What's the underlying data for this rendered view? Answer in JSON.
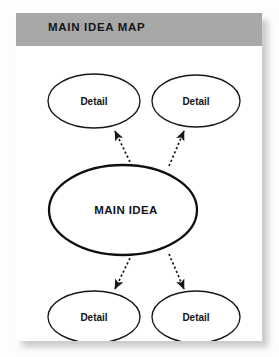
{
  "header": {
    "title": "MAIN IDEA MAP"
  },
  "colors": {
    "header_band": "#a8a8a8",
    "card_background": "#ffffff",
    "page_background": "#fdfdfd",
    "ink": "#15171b"
  },
  "diagram": {
    "type": "concept-map",
    "center_node": {
      "label": "MAIN IDEA",
      "shape": "ellipse",
      "cx": 107,
      "cy": 164,
      "rx": 74,
      "ry": 45
    },
    "detail_nodes": [
      {
        "id": "detail-top-left",
        "label": "Detail",
        "shape": "ellipse",
        "cx": 78,
        "cy": 55,
        "rx": 46,
        "ry": 27
      },
      {
        "id": "detail-top-right",
        "label": "Detail",
        "shape": "ellipse",
        "cx": 180,
        "cy": 55,
        "rx": 44,
        "ry": 26
      },
      {
        "id": "detail-bottom-left",
        "label": "Detail",
        "shape": "ellipse",
        "cx": 78,
        "cy": 271,
        "rx": 46,
        "ry": 26
      },
      {
        "id": "detail-bottom-right",
        "label": "Detail",
        "shape": "ellipse",
        "cx": 180,
        "cy": 271,
        "rx": 44,
        "ry": 26
      }
    ],
    "connectors": [
      {
        "id": "connector-to-top-left",
        "from": "center",
        "to": "detail-top-left",
        "style": "dotted",
        "arrowhead": "end",
        "x1": 116,
        "y1": 120,
        "x2": 99,
        "y2": 85
      },
      {
        "id": "connector-to-top-right",
        "from": "center",
        "to": "detail-top-right",
        "style": "dotted",
        "arrowhead": "end",
        "x1": 153,
        "y1": 120,
        "x2": 168,
        "y2": 85
      },
      {
        "id": "connector-to-bottom-left",
        "from": "center",
        "to": "detail-bottom-left",
        "style": "dotted",
        "arrowhead": "end",
        "x1": 116,
        "y1": 208,
        "x2": 99,
        "y2": 243
      },
      {
        "id": "connector-to-bottom-right",
        "from": "center",
        "to": "detail-bottom-right",
        "style": "dotted",
        "arrowhead": "end",
        "x1": 153,
        "y1": 208,
        "x2": 168,
        "y2": 243
      }
    ]
  }
}
